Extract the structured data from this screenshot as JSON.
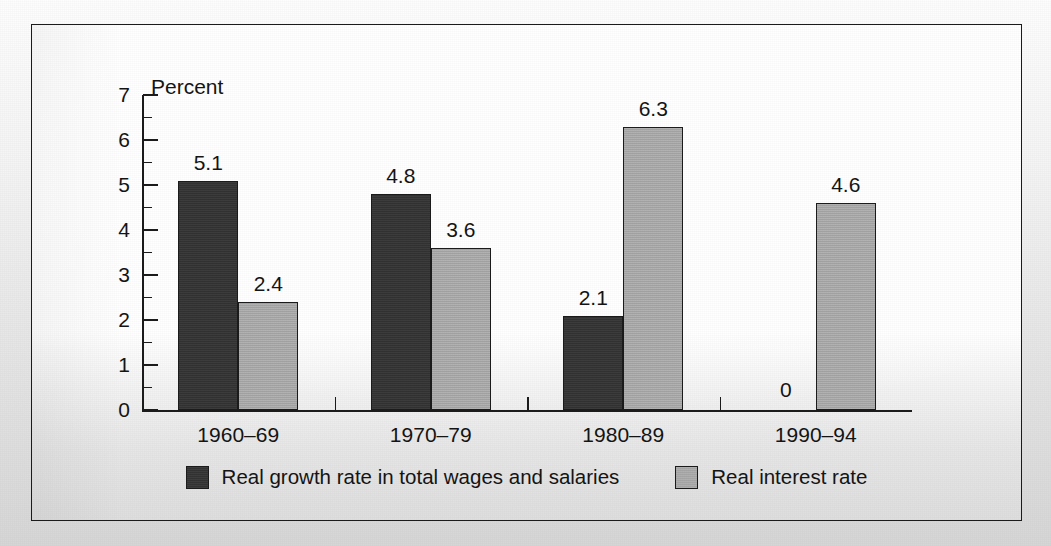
{
  "chart_data": {
    "type": "bar",
    "title": "",
    "xlabel": "",
    "ylabel": "Percent",
    "ylim": [
      0,
      7
    ],
    "ytick_labels": [
      "0",
      "1",
      "2",
      "3",
      "4",
      "5",
      "6",
      "7"
    ],
    "ytick_values": [
      0,
      1,
      2,
      3,
      4,
      5,
      6,
      7
    ],
    "minor_tick_values": [
      0.5,
      1.5,
      2.5,
      3.5,
      4.5,
      5.5,
      6.5
    ],
    "grid": false,
    "legend_position": "bottom-center",
    "categories": [
      "1960–69",
      "1970–79",
      "1980–89",
      "1990–94"
    ],
    "series": [
      {
        "name": "Real growth rate in total wages and salaries",
        "color": "#323232",
        "values": [
          5.1,
          4.8,
          2.1,
          0
        ],
        "labels": [
          "5.1",
          "4.8",
          "2.1",
          "0"
        ]
      },
      {
        "name": "Real interest rate",
        "color": "#a9a9a9",
        "values": [
          2.4,
          3.6,
          6.3,
          4.6
        ],
        "labels": [
          "2.4",
          "3.6",
          "6.3",
          "4.6"
        ]
      }
    ]
  },
  "axis": {
    "y_axis_title": "Percent"
  },
  "legend": {
    "items": [
      {
        "label": "Real growth rate in total wages and salaries",
        "swatch": "dark"
      },
      {
        "label": "Real interest rate",
        "swatch": "light"
      }
    ]
  },
  "colors": {
    "dark_series": "#323232",
    "light_series": "#a9a9a9",
    "axis": "#1b1b1b",
    "frame": "#1b1b1b",
    "text": "#141414"
  }
}
